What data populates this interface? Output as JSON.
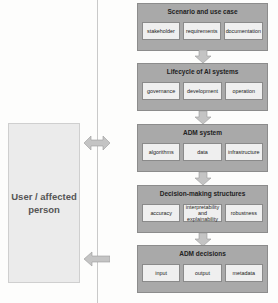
{
  "diagram": {
    "actor": {
      "label": "User / affected person"
    },
    "stages": [
      {
        "title": "Scenario and use case",
        "items": [
          "stakeholder",
          "requirements",
          "documentation"
        ]
      },
      {
        "title": "Lifecycle of AI systems",
        "items": [
          "governance",
          "development",
          "operation"
        ]
      },
      {
        "title": "ADM system",
        "items": [
          "algorithms",
          "data",
          "infrastructure"
        ]
      },
      {
        "title": "Decision-making structures",
        "items": [
          "accuracy",
          "interpretability and explainability",
          "robustness"
        ]
      },
      {
        "title": "ADM decisions",
        "items": [
          "input",
          "output",
          "metadata"
        ]
      }
    ],
    "connections": [
      {
        "from": "Scenario and use case",
        "to": "Lifecycle of AI systems",
        "type": "down-arrow"
      },
      {
        "from": "Lifecycle of AI systems",
        "to": "ADM system",
        "type": "down-arrow"
      },
      {
        "from": "ADM system",
        "to": "Decision-making structures",
        "type": "down-arrow"
      },
      {
        "from": "Decision-making structures",
        "to": "ADM decisions",
        "type": "down-arrow"
      },
      {
        "from": "ADM system",
        "to": "User / affected person",
        "type": "double-arrow"
      },
      {
        "from": "ADM decisions",
        "to": "User / affected person",
        "type": "left-arrow"
      }
    ],
    "colors": {
      "stage_fill": "#a9a9a9",
      "item_fill": "#efefef",
      "actor_fill": "#ebebeb",
      "arrow_fill": "#c4c4c4"
    }
  }
}
